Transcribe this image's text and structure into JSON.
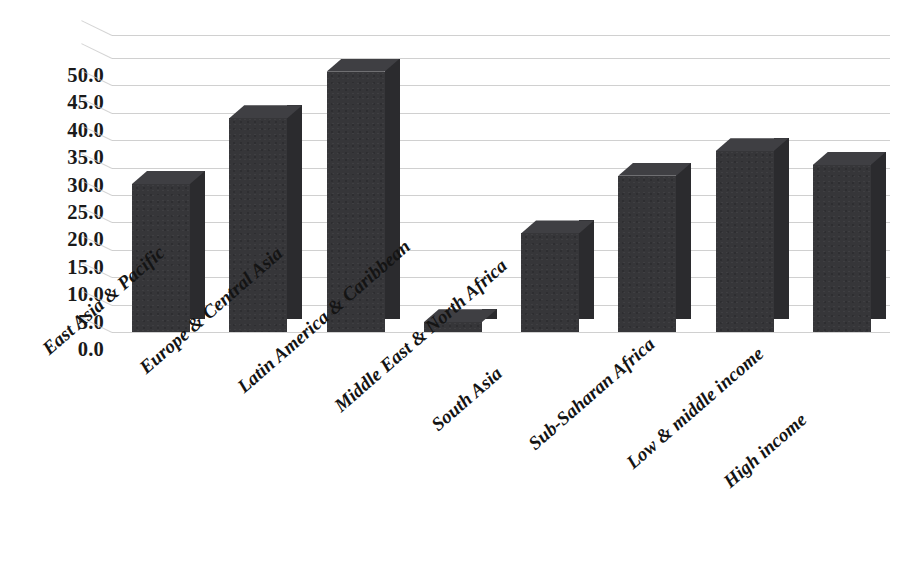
{
  "chart_data": {
    "type": "bar",
    "title": "",
    "subtitle": "",
    "xlabel": "",
    "ylabel": "",
    "legend": [],
    "legend_position": "none",
    "grid": true,
    "style": "3d-column",
    "bar_color": "#363639",
    "bar_side_color": "#2b2b2e",
    "bar_top_color": "#3f3f43",
    "gridline_color": "#c8c8c8",
    "background_color": "#ffffff",
    "ylim": [
      0.0,
      50.0
    ],
    "ytick_step": 5.0,
    "ytick_labels": [
      "50.0",
      "45.0",
      "40.0",
      "35.0",
      "30.0",
      "25.0",
      "20.0",
      "15.0",
      "10.0",
      "5.0",
      "0.0"
    ],
    "ytick_values": [
      50.0,
      45.0,
      40.0,
      35.0,
      30.0,
      25.0,
      20.0,
      15.0,
      10.0,
      5.0,
      0.0
    ],
    "categories": [
      "East Asia & Pacific",
      "Europe & Central Asia",
      "Latin America & Caribbean",
      "Middle East & North Africa",
      "South Asia",
      "Sub-Saharan Africa",
      "Low & middle income",
      "High income"
    ],
    "values": [
      27.0,
      39.0,
      47.5,
      1.8,
      18.0,
      28.5,
      33.0,
      30.5
    ]
  }
}
